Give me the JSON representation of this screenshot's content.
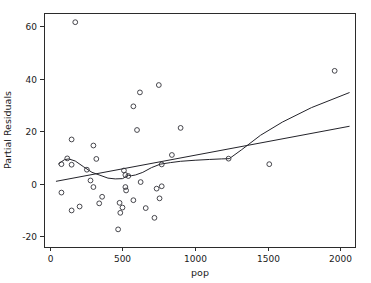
{
  "chart_data": {
    "type": "scatter",
    "title": "",
    "xlabel": "pop",
    "ylabel": "Partial Residuals",
    "xlim": [
      -40,
      2100
    ],
    "ylim": [
      -24,
      65
    ],
    "xticks": [
      0,
      500,
      1000,
      1500,
      2000
    ],
    "xticklabels": [
      "0",
      "500",
      "1000",
      "1500",
      "2000"
    ],
    "yticks": [
      -20,
      0,
      20,
      40,
      60
    ],
    "yticklabels": [
      "-20",
      "0",
      "20",
      "40",
      "60"
    ],
    "grid": false,
    "legend": null,
    "frame": "box",
    "marker": "open-circle",
    "points": [
      [
        175,
        61.5
      ],
      [
        1960,
        43.0
      ],
      [
        750,
        37.6
      ],
      [
        620,
        34.8
      ],
      [
        575,
        29.5
      ],
      [
        600,
        20.5
      ],
      [
        900,
        21.3
      ],
      [
        150,
        16.9
      ],
      [
        300,
        14.6
      ],
      [
        320,
        9.5
      ],
      [
        120,
        9.7
      ],
      [
        80,
        7.5
      ],
      [
        150,
        7.3
      ],
      [
        840,
        11.0
      ],
      [
        1230,
        9.6
      ],
      [
        770,
        7.4
      ],
      [
        1510,
        7.5
      ],
      [
        255,
        5.4
      ],
      [
        510,
        5.1
      ],
      [
        520,
        3.4
      ],
      [
        540,
        3.0
      ],
      [
        280,
        1.3
      ],
      [
        625,
        0.7
      ],
      [
        520,
        -1.2
      ],
      [
        300,
        -1.2
      ],
      [
        735,
        -1.8
      ],
      [
        770,
        -0.9
      ],
      [
        80,
        -3.3
      ],
      [
        525,
        -2.5
      ],
      [
        360,
        -4.9
      ],
      [
        575,
        -6.2
      ],
      [
        755,
        -5.5
      ],
      [
        480,
        -7.2
      ],
      [
        340,
        -7.4
      ],
      [
        205,
        -8.6
      ],
      [
        500,
        -9.0
      ],
      [
        660,
        -9.2
      ],
      [
        150,
        -10.1
      ],
      [
        485,
        -11.0
      ],
      [
        720,
        -12.9
      ],
      [
        470,
        -17.3
      ]
    ],
    "series": [
      {
        "name": "linear-fit",
        "type": "line",
        "points": [
          [
            45,
            1.0
          ],
          [
            2060,
            21.9
          ]
        ]
      },
      {
        "name": "lowess-smooth",
        "type": "line",
        "points": [
          [
            60,
            7.6
          ],
          [
            100,
            9.2
          ],
          [
            130,
            9.5
          ],
          [
            175,
            8.7
          ],
          [
            230,
            6.6
          ],
          [
            290,
            4.4
          ],
          [
            345,
            3.3
          ],
          [
            400,
            2.2
          ],
          [
            450,
            1.9
          ],
          [
            500,
            2.0
          ],
          [
            520,
            2.6
          ],
          [
            540,
            3.3
          ],
          [
            560,
            3.1
          ],
          [
            590,
            3.4
          ],
          [
            640,
            4.4
          ],
          [
            700,
            6.2
          ],
          [
            760,
            7.5
          ],
          [
            830,
            8.1
          ],
          [
            900,
            8.6
          ],
          [
            1000,
            9.0
          ],
          [
            1100,
            9.3
          ],
          [
            1180,
            9.5
          ],
          [
            1235,
            9.6
          ],
          [
            1320,
            13.0
          ],
          [
            1450,
            18.5
          ],
          [
            1600,
            23.5
          ],
          [
            1800,
            29.0
          ],
          [
            2060,
            34.7
          ]
        ]
      }
    ]
  },
  "plot_geometry": {
    "left": 44,
    "right": 355,
    "top": 13,
    "bottom": 247,
    "marker_radius": 2.4,
    "tick_length": 4
  }
}
